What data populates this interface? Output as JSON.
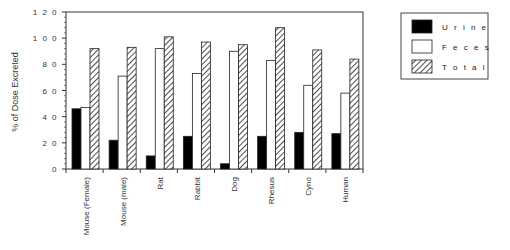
{
  "chart_data": {
    "type": "bar",
    "title": "",
    "xlabel": "",
    "ylabel": "% of Dose Excreted",
    "ylim": [
      0,
      120
    ],
    "yticks": [
      0,
      20,
      40,
      60,
      80,
      100,
      120
    ],
    "ytick_labels": [
      "0",
      "2 0",
      "4 0",
      "6 0",
      "8 0",
      "1 0 0",
      "1 2 0"
    ],
    "grid": false,
    "legend_position": "upper right (outside plot)",
    "categories": [
      "Mouse (Female)",
      "Mouse (male)",
      "Rat",
      "Rabbit",
      "Dog",
      "Rhesus",
      "Cyno",
      "Human"
    ],
    "series": [
      {
        "name": "Urine",
        "style": "solid black",
        "color": "#000000",
        "values": [
          46,
          22,
          10,
          25,
          4,
          25,
          28,
          27
        ]
      },
      {
        "name": "Feces",
        "style": "white outline",
        "color": "#ffffff",
        "values": [
          47,
          71,
          92,
          73,
          90,
          83,
          64,
          58
        ]
      },
      {
        "name": "Total",
        "style": "diagonal hatch",
        "color": "#ffffff",
        "values": [
          92,
          93,
          101,
          97,
          95,
          108,
          91,
          84
        ]
      }
    ]
  },
  "legend": {
    "items": [
      {
        "label": "U r i n e"
      },
      {
        "label": "F e c e s"
      },
      {
        "label": "T o t a l"
      }
    ]
  }
}
